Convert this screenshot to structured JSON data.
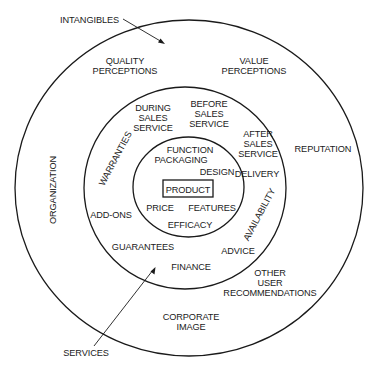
{
  "diagram": {
    "type": "concentric-rings",
    "center": "PRODUCT",
    "rings": [
      {
        "name": "core",
        "labels": [
          "PRODUCT"
        ]
      },
      {
        "name": "inner-ring",
        "labels": [
          "FUNCTION",
          "PACKAGING",
          "DESIGN",
          "PRICE",
          "FEATURES",
          "EFFICACY"
        ]
      },
      {
        "name": "services-ring",
        "labels": [
          "DURING SALES SERVICE",
          "BEFORE SALES SERVICE",
          "AFTER SALES SERVICE",
          "WARRANTIES",
          "DELIVERY",
          "ADD-ONS",
          "AVAILABILITY",
          "GUARANTEES",
          "ADVICE",
          "FINANCE"
        ]
      },
      {
        "name": "intangibles-ring",
        "labels": [
          "QUALITY PERCEPTIONS",
          "VALUE PERCEPTIONS",
          "ORGANIZATION",
          "REPUTATION",
          "OTHER USER RECOMMENDATIONS",
          "CORPORATE IMAGE"
        ]
      }
    ],
    "callouts": {
      "intangibles": "INTANGIBLES",
      "services": "SERVICES"
    },
    "core": {
      "product": "PRODUCT"
    },
    "inner": {
      "function": "FUNCTION",
      "packaging": "PACKAGING",
      "design": "DESIGN",
      "price": "PRICE",
      "features": "FEATURES",
      "efficacy": "EFFICACY"
    },
    "services": {
      "during_sales": [
        "DURING",
        "SALES",
        "SERVICE"
      ],
      "before_sales": [
        "BEFORE",
        "SALES",
        "SERVICE"
      ],
      "after_sales": [
        "AFTER",
        "SALES",
        "SERVICE"
      ],
      "warranties": "WARRANTIES",
      "delivery": "DELIVERY",
      "add_ons": "ADD-ONS",
      "availability": "AVAILABILITY",
      "guarantees": "GUARANTEES",
      "advice": "ADVICE",
      "finance": "FINANCE"
    },
    "intangibles": {
      "quality_perceptions": [
        "QUALITY",
        "PERCEPTIONS"
      ],
      "value_perceptions": [
        "VALUE",
        "PERCEPTIONS"
      ],
      "organization": "ORGANIZATION",
      "reputation": "REPUTATION",
      "other_user_recommendations": [
        "OTHER",
        "USER",
        "RECOMMENDATIONS"
      ],
      "corporate_image": [
        "CORPORATE",
        "IMAGE"
      ]
    }
  }
}
